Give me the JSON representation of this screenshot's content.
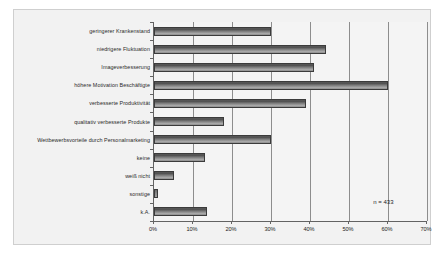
{
  "chart_data": {
    "type": "bar",
    "orientation": "horizontal",
    "title": "",
    "subtitle": "",
    "xlabel": "",
    "ylabel": "",
    "xlim": [
      0,
      70
    ],
    "grid": true,
    "legend": null,
    "annotation": "n = 433",
    "xticks": [
      "0%",
      "10%",
      "20%",
      "30%",
      "40%",
      "50%",
      "60%",
      "70%"
    ],
    "xtick_values": [
      0,
      10,
      20,
      30,
      40,
      50,
      60,
      70
    ],
    "categories": [
      "geringerer Krankenstand",
      "niedrigere Fluktuation",
      "Imageverbesserung",
      "höhere Motivation Beschäftigte",
      "verbesserte Produktivität",
      "qualitativ verbesserte Produkte",
      "Wettbewerbsvorteile durch Personalmarketing",
      "keine",
      "weiß nicht",
      "sonstige",
      "k.A."
    ],
    "values": [
      30,
      44,
      41,
      60,
      39,
      18,
      30,
      13,
      5,
      1,
      13.5
    ],
    "series": [
      {
        "name": "Anteil",
        "values": [
          30,
          44,
          41,
          60,
          39,
          18,
          30,
          13,
          5,
          1,
          13.5
        ]
      }
    ]
  },
  "colors": {
    "frame_background": "#f2f2f2",
    "plot_background": "#f4f4f4",
    "frame_border": "#cfcfcf",
    "axis": "#636363",
    "gridline": "#8d8d8d",
    "bar_dark": "#4a4a4a",
    "bar_light": "#a8a8a8",
    "bar_border": "#3b3b3b",
    "text": "#242424"
  }
}
